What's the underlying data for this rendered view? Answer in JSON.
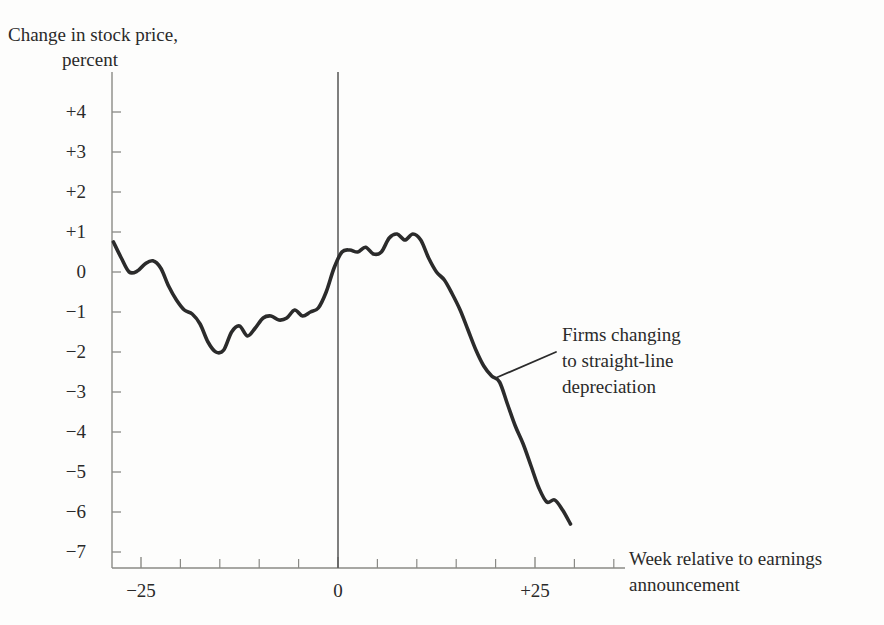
{
  "chart_data": {
    "type": "line",
    "title": "Change in stock price, percent",
    "title_line1": "Change in stock price,",
    "title_line2": "percent",
    "xlabel": "Week relative to earnings announcement",
    "xlabel_line1": "Week relative to earnings",
    "xlabel_line2": "announcement",
    "ylabel": "Change in stock price, percent",
    "xlim": [
      -29,
      29
    ],
    "ylim": [
      -7,
      4
    ],
    "grid": false,
    "legend": "none",
    "line_color": "#2b2b2b",
    "axis_color": "#8a8a86",
    "background_color": "#fdfdfc",
    "yticks": [
      "+4",
      "+3",
      "+2",
      "+1",
      "0",
      "−1",
      "−2",
      "−3",
      "−4",
      "−5",
      "−6",
      "−7"
    ],
    "ytick_values": [
      4,
      3,
      2,
      1,
      0,
      -1,
      -2,
      -3,
      -4,
      -5,
      -6,
      -7
    ],
    "xticks": [
      "−25",
      "0",
      "+25"
    ],
    "xtick_values": [
      -25,
      0,
      25
    ],
    "xtick_minor_values": [
      -29,
      -20,
      -15,
      -10,
      -5,
      5,
      10,
      15,
      20,
      30,
      35
    ],
    "annotations": [
      {
        "text": "Firms changing to straight-line depreciation",
        "line1": "Firms changing",
        "line2": "to straight-line",
        "line3": "depreciation",
        "points_to_week": 20,
        "points_to_value": -2.65
      }
    ],
    "reference_line": {
      "x": 0,
      "label": "announcement week"
    },
    "series": [
      {
        "name": "Firms changing to straight-line depreciation",
        "x": [
          -28.5,
          -27.5,
          -26.5,
          -25.5,
          -24.5,
          -23.5,
          -22.5,
          -21.5,
          -20.5,
          -19.5,
          -18.5,
          -17.5,
          -16.5,
          -15.5,
          -14.5,
          -13.5,
          -12.5,
          -11.5,
          -10.5,
          -9.5,
          -8.5,
          -7.5,
          -6.5,
          -5.5,
          -4.5,
          -3.5,
          -2.5,
          -1.5,
          -0.5,
          0.5,
          1.5,
          2.5,
          3.5,
          4.5,
          5.5,
          6.5,
          7.5,
          8.5,
          9.5,
          10.5,
          11.5,
          12.5,
          13.5,
          14.5,
          15.5,
          16.5,
          17.5,
          18.5,
          19.5,
          20.5,
          21.5,
          22.5,
          23.5,
          24.5,
          25.5,
          26.5,
          27.5,
          28.5,
          29.5
        ],
        "y": [
          0.75,
          0.35,
          0.0,
          0.02,
          0.2,
          0.28,
          0.1,
          -0.35,
          -0.7,
          -0.95,
          -1.05,
          -1.3,
          -1.75,
          -2.0,
          -1.95,
          -1.5,
          -1.35,
          -1.6,
          -1.4,
          -1.15,
          -1.1,
          -1.2,
          -1.15,
          -0.95,
          -1.1,
          -1.0,
          -0.9,
          -0.5,
          0.1,
          0.5,
          0.55,
          0.5,
          0.62,
          0.45,
          0.5,
          0.85,
          0.95,
          0.8,
          0.95,
          0.8,
          0.35,
          0.0,
          -0.2,
          -0.55,
          -0.95,
          -1.45,
          -1.95,
          -2.35,
          -2.6,
          -2.75,
          -3.3,
          -3.85,
          -4.3,
          -4.85,
          -5.4,
          -5.75,
          -5.7,
          -5.95,
          -6.3
        ]
      }
    ]
  }
}
